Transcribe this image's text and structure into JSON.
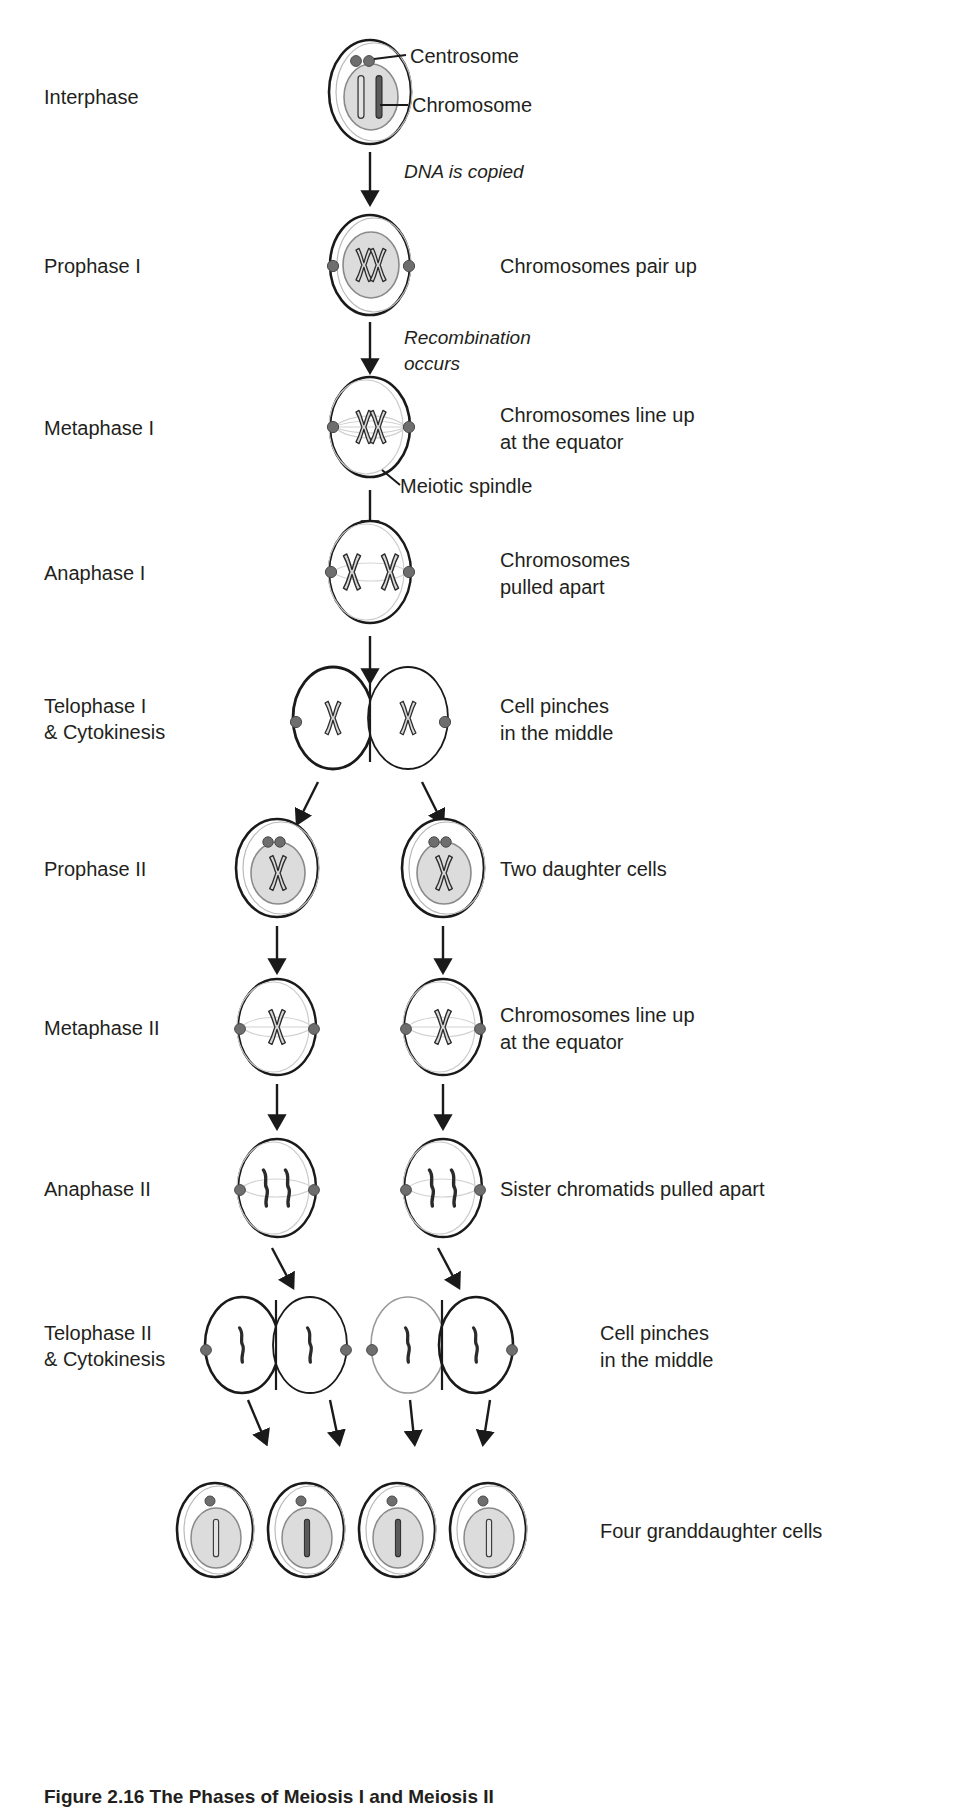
{
  "figure": {
    "title": "The Phases of Meiosis I and Meiosis II",
    "caption_prefix": "Figure 2.16 The Phases of Meiosis I and Meiosis II"
  },
  "colors": {
    "ink": "#231f20",
    "membrane": "#1a1a1a",
    "nucleus_fill": "#dcdcdc",
    "nucleus_stroke": "#8a8a8a",
    "centrosome": "#6e6e6e",
    "chromosome_light": "#bdbdbd",
    "chromosome_dark": "#555555",
    "spindle": "#cfcfcf",
    "background": "#ffffff"
  },
  "callouts": [
    {
      "id": "centrosome",
      "label": "Centrosome"
    },
    {
      "id": "chromosome",
      "label": "Chromosome"
    },
    {
      "id": "meiotic-spindle",
      "label": "Meiotic spindle"
    }
  ],
  "transitions": [
    {
      "id": "dna-copied",
      "text": "DNA is copied"
    },
    {
      "id": "recombination",
      "text": "Recombination\noccurs"
    }
  ],
  "rows": [
    {
      "id": "interphase",
      "phase": "Interphase",
      "description": "",
      "cells": 1
    },
    {
      "id": "prophase-1",
      "phase": "Prophase I",
      "description": "Chromosomes pair up",
      "cells": 1
    },
    {
      "id": "metaphase-1",
      "phase": "Metaphase I",
      "description": "Chromosomes line up\nat the equator",
      "cells": 1
    },
    {
      "id": "anaphase-1",
      "phase": "Anaphase I",
      "description": "Chromosomes\npulled apart",
      "cells": 1
    },
    {
      "id": "telophase-1",
      "phase": "Telophase I\n& Cytokinesis",
      "description": "Cell pinches\nin the middle",
      "cells": 2
    },
    {
      "id": "prophase-2",
      "phase": "Prophase II",
      "description": "Two daughter cells",
      "cells": 2
    },
    {
      "id": "metaphase-2",
      "phase": "Metaphase II",
      "description": "Chromosomes line up\nat the equator",
      "cells": 2
    },
    {
      "id": "anaphase-2",
      "phase": "Anaphase II",
      "description": "Sister chromatids pulled apart",
      "cells": 2
    },
    {
      "id": "telophase-2",
      "phase": "Telophase II\n& Cytokinesis",
      "description": "Cell pinches\nin the middle",
      "cells": 4
    },
    {
      "id": "granddaughter",
      "phase": "",
      "description": "Four granddaughter cells",
      "cells": 4
    }
  ]
}
